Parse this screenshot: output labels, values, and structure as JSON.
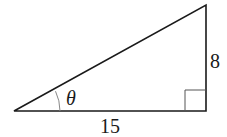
{
  "diagram": {
    "type": "right-triangle",
    "labels": {
      "angle": "θ",
      "base": "15",
      "height": "8"
    },
    "colors": {
      "stroke": "#1a1a1a",
      "arc": "#888888",
      "background": "#ffffff"
    }
  }
}
